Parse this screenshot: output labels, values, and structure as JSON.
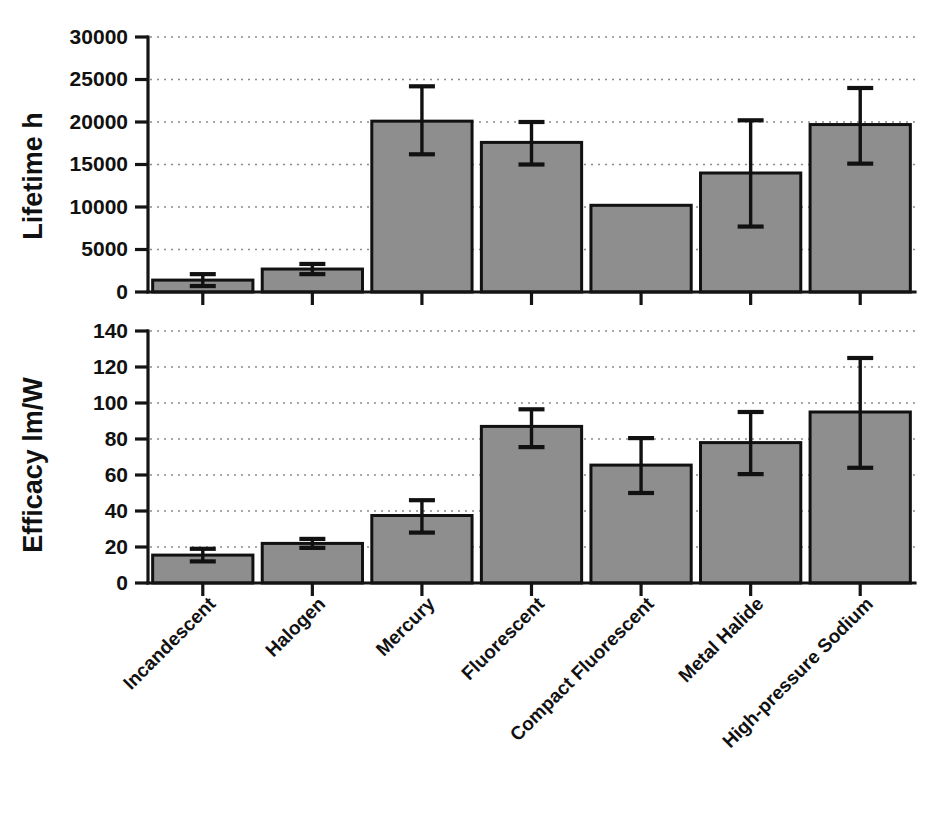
{
  "figure": {
    "title": "",
    "background_color": "#ffffff",
    "bar_fill_color": "#8e8e8e",
    "bar_edge_color": "#111111",
    "grid_color": "#8c8c8c",
    "axis_color": "#141414",
    "category_label_rotation_deg": -45
  },
  "chart_data": [
    {
      "type": "bar",
      "panel": "top",
      "title": "",
      "xlabel": "",
      "ylabel": "Lifetime h",
      "ylim": [
        0,
        30000
      ],
      "yticks": [
        0,
        5000,
        10000,
        15000,
        20000,
        25000,
        30000
      ],
      "ytick_labels": [
        "0",
        "5000",
        "10000",
        "15000",
        "20000",
        "25000",
        "30000"
      ],
      "grid": true,
      "grid_axis": "y",
      "grid_style": "dotted",
      "legend": "none",
      "categories": [
        "Incandescent",
        "Halogen",
        "Mercury",
        "Fluorescent",
        "Compact Fluorescent",
        "Metal Halide",
        "High-pressure Sodium"
      ],
      "values": [
        1400,
        2700,
        20100,
        17600,
        10200,
        14000,
        19700
      ],
      "error_upper": [
        700,
        600,
        4100,
        2400,
        0,
        6200,
        4300
      ],
      "error_lower": [
        700,
        600,
        3900,
        2600,
        0,
        6300,
        4600
      ],
      "error_bar_present": [
        true,
        true,
        true,
        true,
        false,
        true,
        true
      ]
    },
    {
      "type": "bar",
      "panel": "bottom",
      "title": "",
      "xlabel": "",
      "ylabel": "Efficacy lm/W",
      "ylim": [
        0,
        140
      ],
      "yticks": [
        0,
        20,
        40,
        60,
        80,
        100,
        120,
        140
      ],
      "ytick_labels": [
        "0",
        "20",
        "40",
        "60",
        "80",
        "100",
        "120",
        "140"
      ],
      "grid": true,
      "grid_axis": "y",
      "grid_style": "dotted",
      "legend": "none",
      "categories": [
        "Incandescent",
        "Halogen",
        "Mercury",
        "Fluorescent",
        "Compact Fluorescent",
        "Metal Halide",
        "High-pressure Sodium"
      ],
      "values": [
        15.5,
        22,
        37.5,
        87,
        65.5,
        78,
        95
      ],
      "error_upper": [
        3.5,
        2.5,
        8.5,
        9.5,
        15,
        17,
        30
      ],
      "error_lower": [
        3.5,
        2.5,
        9.5,
        11.5,
        15.5,
        17.5,
        31
      ],
      "error_bar_present": [
        true,
        true,
        true,
        true,
        true,
        true,
        true
      ]
    }
  ]
}
